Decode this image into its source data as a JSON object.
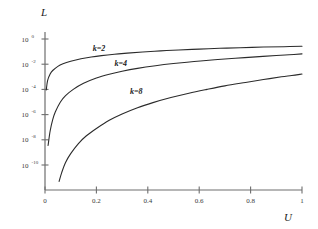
{
  "chart_data": {
    "type": "line",
    "title": "",
    "xlabel": "U",
    "ylabel": "L",
    "xlim": [
      0,
      1
    ],
    "ylim_log10": [
      -11.6,
      0.4
    ],
    "grid": false,
    "legend_position": "inline-annotations",
    "xticks": [
      0,
      0.2,
      0.4,
      0.6,
      0.8,
      1
    ],
    "xtick_labels": [
      "0",
      "0.2",
      "0.4",
      "0.6",
      "0.8",
      "1"
    ],
    "yticks_log10": [
      0,
      -2,
      -4,
      -6,
      -8,
      -10
    ],
    "ytick_labels": [
      {
        "mantissa": "10",
        "exponent": "0"
      },
      {
        "mantissa": "10",
        "exponent": "-2"
      },
      {
        "mantissa": "10",
        "exponent": "-4"
      },
      {
        "mantissa": "10",
        "exponent": "-6"
      },
      {
        "mantissa": "10",
        "exponent": "-8"
      },
      {
        "mantissa": "10",
        "exponent": "-10"
      }
    ],
    "series": [
      {
        "name": "k=2",
        "label": "k=2",
        "label_x": 0.21,
        "label_y_log10": -0.95,
        "x": [
          0.005,
          0.01,
          0.02,
          0.03,
          0.05,
          0.07,
          0.1,
          0.14,
          0.18,
          0.22,
          0.27,
          0.32,
          0.38,
          0.45,
          0.52,
          0.6,
          0.68,
          0.76,
          0.85,
          0.93,
          1.0
        ],
        "y_log10": [
          -4.05,
          -3.3,
          -2.78,
          -2.5,
          -2.17,
          -1.97,
          -1.77,
          -1.57,
          -1.43,
          -1.32,
          -1.21,
          -1.12,
          -1.03,
          -0.94,
          -0.87,
          -0.8,
          -0.74,
          -0.69,
          -0.64,
          -0.61,
          -0.58
        ]
      },
      {
        "name": "k=4",
        "label": "k=4",
        "label_x": 0.295,
        "label_y_log10": -2.15,
        "x": [
          0.012,
          0.02,
          0.03,
          0.04,
          0.06,
          0.08,
          0.11,
          0.15,
          0.2,
          0.25,
          0.3,
          0.36,
          0.43,
          0.5,
          0.58,
          0.66,
          0.74,
          0.82,
          0.9,
          0.95,
          1.0
        ],
        "y_log10": [
          -8.45,
          -7.3,
          -6.4,
          -5.8,
          -5.0,
          -4.5,
          -4.0,
          -3.52,
          -3.1,
          -2.8,
          -2.56,
          -2.33,
          -2.12,
          -1.95,
          -1.79,
          -1.65,
          -1.53,
          -1.42,
          -1.31,
          -1.25,
          -1.18
        ]
      },
      {
        "name": "k=8",
        "label": "k=8",
        "label_x": 0.355,
        "label_y_log10": -4.35,
        "x": [
          0.055,
          0.065,
          0.08,
          0.1,
          0.13,
          0.16,
          0.2,
          0.25,
          0.3,
          0.36,
          0.42,
          0.49,
          0.56,
          0.63,
          0.7,
          0.78,
          0.85,
          0.92,
          0.96,
          1.0
        ],
        "y_log10": [
          -11.3,
          -10.6,
          -9.8,
          -9.1,
          -8.3,
          -7.7,
          -7.1,
          -6.45,
          -5.95,
          -5.45,
          -5.05,
          -4.65,
          -4.3,
          -4.0,
          -3.72,
          -3.45,
          -3.22,
          -3.0,
          -2.9,
          -2.78
        ]
      }
    ],
    "colors": {
      "curve": "#2b2b2b",
      "axis": "#6e6e6e",
      "text": "#1a1a1a",
      "background": "#ffffff"
    }
  }
}
